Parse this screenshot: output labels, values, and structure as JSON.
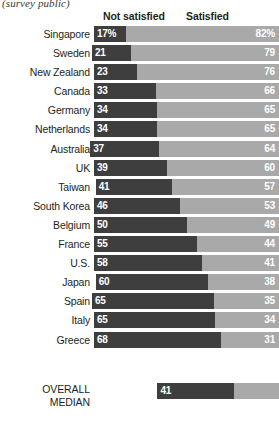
{
  "note": "(survey public)",
  "headers": {
    "not_satisfied": "Not satisfied",
    "satisfied": "Satisfied"
  },
  "colors": {
    "not_satisfied": "#3e3e3e",
    "satisfied": "#a9a9a9",
    "text": "#231f20",
    "value_text": "#ffffff",
    "background": "#ffffff"
  },
  "median": {
    "label_line1": "OVERALL",
    "label_line2": "MEDIAN",
    "not_satisfied": "41",
    "satisfied": "57"
  },
  "chart_data": {
    "type": "bar",
    "subtype": "diverging-stacked-bar",
    "title": "",
    "subtitle": "(survey public)",
    "xlabel": "",
    "ylabel": "",
    "xlim": [
      0,
      100
    ],
    "grid": false,
    "legend_position": "top",
    "legend": [
      "Not satisfied",
      "Satisfied"
    ],
    "categories": [
      "Singapore",
      "Sweden",
      "New Zealand",
      "Canada",
      "Germany",
      "Netherlands",
      "Australia",
      "UK",
      "Taiwan",
      "South Korea",
      "Belgium",
      "France",
      "U.S.",
      "Japan",
      "Spain",
      "Italy",
      "Greece"
    ],
    "series": [
      {
        "name": "Not satisfied",
        "values": [
          17,
          21,
          23,
          33,
          34,
          34,
          37,
          39,
          41,
          46,
          50,
          55,
          58,
          60,
          65,
          65,
          68
        ]
      },
      {
        "name": "Satisfied",
        "values": [
          82,
          79,
          76,
          66,
          65,
          65,
          64,
          60,
          57,
          53,
          49,
          44,
          41,
          38,
          35,
          34,
          31
        ]
      }
    ],
    "value_labels": {
      "Not satisfied": [
        "17%",
        "21",
        "23",
        "33",
        "34",
        "34",
        "37",
        "39",
        "41",
        "46",
        "50",
        "55",
        "58",
        "60",
        "65",
        "65",
        "68"
      ],
      "Satisfied": [
        "82%",
        "79",
        "76",
        "66",
        "65",
        "65",
        "64",
        "60",
        "57",
        "53",
        "49",
        "44",
        "41",
        "38",
        "35",
        "34",
        "31"
      ]
    },
    "summary_row": {
      "label": "OVERALL MEDIAN",
      "not_satisfied": 41,
      "satisfied": 57
    }
  }
}
